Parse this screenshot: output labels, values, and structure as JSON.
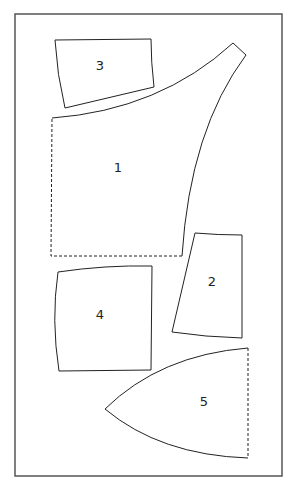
{
  "diagram": {
    "type": "sewing-pattern-layout",
    "background": "#ffffff",
    "stroke_color": "#222222",
    "frame_color": "#555555",
    "pieces": [
      {
        "id": "1",
        "label": "1",
        "edges": "solid curved top and right, dashed left and bottom"
      },
      {
        "id": "2",
        "label": "2",
        "edges": "solid"
      },
      {
        "id": "3",
        "label": "3",
        "edges": "solid"
      },
      {
        "id": "4",
        "label": "4",
        "edges": "solid"
      },
      {
        "id": "5",
        "label": "5",
        "edges": "solid curved, dashed right"
      }
    ]
  }
}
